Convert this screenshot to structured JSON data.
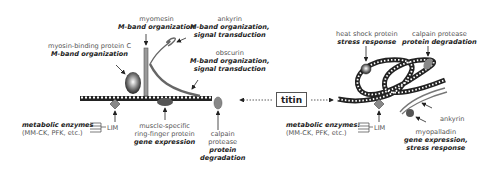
{
  "center_label": "titin",
  "left_panel": {
    "labels": {
      "myomesin": {
        "name": "myomesin",
        "function": "M-band organization"
      },
      "ankyrin": {
        "name": "ankyrin",
        "function_line1": "M-band organization,",
        "function_line2": "signal transduction"
      },
      "mybpc": {
        "name": "myosin-binding protein C",
        "function": "M-band organization"
      },
      "obscurin": {
        "name": "obscurin",
        "function_line1": "M-band organization,",
        "function_line2": "signal transduction"
      },
      "metabolic": {
        "function": "metabolic enzymes",
        "name": "(MM-CK,  PFK, etc.)"
      },
      "lim": {
        "name": "LIM"
      },
      "murf": {
        "name_line1": "muscle-specific",
        "name_line2": "ring-finger protein",
        "function": "gene expression"
      },
      "calpain": {
        "name_line1": "calpain",
        "name_line2": "protease",
        "function_line1": "protein",
        "function_line2": "degradation"
      }
    }
  },
  "right_panel": {
    "labels": {
      "hsp": {
        "name": "heat shock protein",
        "function": "stress response"
      },
      "calpain": {
        "name": "calpain protease",
        "function": "protein degradation"
      },
      "metabolic": {
        "function": "metabolic enzymes:",
        "name": "(MM-CK,  PFK, etc.)"
      },
      "lim": {
        "name": "LIM"
      },
      "ankyrin": {
        "name": "ankyrin"
      },
      "myopalladin": {
        "name": "myopalladin",
        "function_line1": "gene expression,",
        "function_line2": "stress response"
      }
    }
  },
  "colors": {
    "strand": "#222222",
    "protein_gray": "#777777",
    "background": "#ffffff"
  }
}
